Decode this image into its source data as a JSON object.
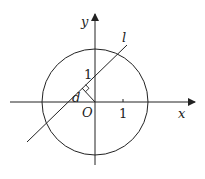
{
  "diagram": {
    "type": "coordinate-geometry",
    "axes": {
      "x_label": "x",
      "y_label": "y",
      "origin_label": "O",
      "x_tick_label": "1",
      "y_tick_label": "1"
    },
    "line_label": "l",
    "distance_label": "d",
    "colors": {
      "stroke": "#222222",
      "background": "#ffffff"
    }
  }
}
